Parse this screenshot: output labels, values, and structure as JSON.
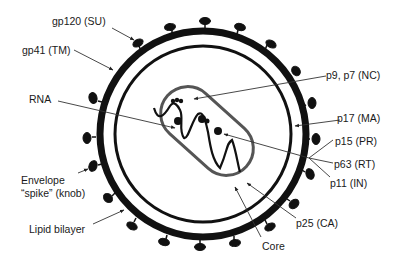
{
  "diagram": {
    "colors": {
      "ink": "#111111",
      "core_outline": "#555555",
      "leader": "#444444",
      "background": "#ffffff"
    },
    "labels": {
      "gp120": "gp120 (SU)",
      "gp41": "gp41 (TM)",
      "rna": "RNA",
      "envelope_line1": "Envelope",
      "envelope_line2": "“spike” (knob)",
      "lipid": "Lipid bilayer",
      "p9p7": "p9, p7 (NC)",
      "p17": "p17 (MA)",
      "p15": "p15 (PR)",
      "p63": "p63 (RT)",
      "p11": "p11 (IN)",
      "p25": "p25 (CA)",
      "core": "Core"
    }
  }
}
